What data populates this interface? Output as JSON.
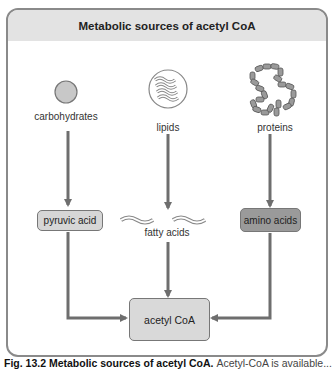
{
  "diagram": {
    "title": "Metabolic sources of acetyl CoA",
    "sources": [
      {
        "id": "carbohydrates",
        "label": "carbohydrates",
        "icon": "circle-icon"
      },
      {
        "id": "lipids",
        "label": "lipids",
        "icon": "lipid-waves-icon"
      },
      {
        "id": "proteins",
        "label": "proteins",
        "icon": "protein-chain-icon"
      }
    ],
    "intermediates": [
      {
        "id": "pyruvic-acid",
        "label": "pyruvic acid",
        "fill": "#d6d6d6"
      },
      {
        "id": "fatty-acids",
        "label": "fatty acids"
      },
      {
        "id": "amino-acids",
        "label": "amino acids",
        "fill": "#9a9a9a"
      }
    ],
    "product": {
      "label": "acetyl CoA",
      "fill": "#d9d9d9"
    },
    "colors": {
      "arrow": "#6e6e6e",
      "title_bar": "#e3e3e3",
      "frame_border": "#8a8a8a"
    }
  },
  "caption": {
    "bold": "Fig. 13.2 Metabolic sources of acetyl CoA.",
    "rest": "Acetyl-CoA is available..."
  }
}
